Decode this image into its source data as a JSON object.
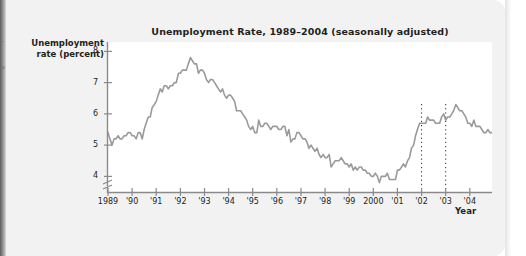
{
  "page": {
    "margin_marks": [
      {
        "text": "–",
        "x": 1,
        "y": 40
      },
      {
        "text": "a",
        "x": 1,
        "y": 66
      }
    ]
  },
  "figure": {
    "title": "Unemployment Rate, 1989–2004 (seasonally adjusted)",
    "y_axis_label_line1": "Unemployment",
    "y_axis_label_line2": "rate (percent)",
    "x_axis_label": "Year",
    "line_color": "#9a9a9a",
    "axis_color": "#7a7a7a",
    "text_color": "#231f20",
    "panel_color": "#ffffff",
    "card_color": "#f2f2f2"
  },
  "chart_data": {
    "type": "line",
    "title": "Unemployment Rate, 1989–2004 (seasonally adjusted)",
    "xlabel": "Year",
    "ylabel": "Unemployment rate (percent)",
    "xlim": [
      1989,
      2004.92
    ],
    "ylim": [
      3.5,
      8.3
    ],
    "y_axis_break": true,
    "grid": false,
    "legend": "none",
    "ytick_labels": [
      "8",
      "7",
      "6",
      "5",
      "4"
    ],
    "ytick_values": [
      8,
      7,
      6,
      5,
      4
    ],
    "xtick_labels": [
      "1989",
      "'90",
      "'91",
      "'92",
      "'93",
      "'94",
      "'95",
      "'96",
      "'97",
      "'98",
      "'99",
      "2000",
      "'01",
      "'02",
      "'03",
      "'04"
    ],
    "xtick_values": [
      1989,
      1990,
      1991,
      1992,
      1993,
      1994,
      1995,
      1996,
      1997,
      1998,
      1999,
      2000,
      2001,
      2002,
      2003,
      2004
    ],
    "annotations": [
      {
        "name": "dotted-line-2002",
        "type": "vertical-dotted-line",
        "x": 2002
      },
      {
        "name": "dotted-line-2003",
        "type": "vertical-dotted-line",
        "x": 2003
      }
    ],
    "series": [
      {
        "name": "Unemployment rate",
        "color": "#9a9a9a",
        "x": [
          1989.0,
          1989.08,
          1989.17,
          1989.25,
          1989.33,
          1989.42,
          1989.5,
          1989.58,
          1989.67,
          1989.75,
          1989.83,
          1989.92,
          1990.0,
          1990.08,
          1990.17,
          1990.25,
          1990.33,
          1990.42,
          1990.5,
          1990.58,
          1990.67,
          1990.75,
          1990.83,
          1990.92,
          1991.0,
          1991.08,
          1991.17,
          1991.25,
          1991.33,
          1991.42,
          1991.5,
          1991.58,
          1991.67,
          1991.75,
          1991.83,
          1991.92,
          1992.0,
          1992.08,
          1992.17,
          1992.25,
          1992.33,
          1992.42,
          1992.5,
          1992.58,
          1992.67,
          1992.75,
          1992.83,
          1992.92,
          1993.0,
          1993.08,
          1993.17,
          1993.25,
          1993.33,
          1993.42,
          1993.5,
          1993.58,
          1993.67,
          1993.75,
          1993.83,
          1993.92,
          1994.0,
          1994.08,
          1994.17,
          1994.25,
          1994.33,
          1994.42,
          1994.5,
          1994.58,
          1994.67,
          1994.75,
          1994.83,
          1994.92,
          1995.0,
          1995.08,
          1995.17,
          1995.25,
          1995.33,
          1995.42,
          1995.5,
          1995.58,
          1995.67,
          1995.75,
          1995.83,
          1995.92,
          1996.0,
          1996.08,
          1996.17,
          1996.25,
          1996.33,
          1996.42,
          1996.5,
          1996.58,
          1996.67,
          1996.75,
          1996.83,
          1996.92,
          1997.0,
          1997.08,
          1997.17,
          1997.25,
          1997.33,
          1997.42,
          1997.5,
          1997.58,
          1997.67,
          1997.75,
          1997.83,
          1997.92,
          1998.0,
          1998.08,
          1998.17,
          1998.25,
          1998.33,
          1998.42,
          1998.5,
          1998.58,
          1998.67,
          1998.75,
          1998.83,
          1998.92,
          1999.0,
          1999.08,
          1999.17,
          1999.25,
          1999.33,
          1999.42,
          1999.5,
          1999.58,
          1999.67,
          1999.75,
          1999.83,
          1999.92,
          2000.0,
          2000.08,
          2000.17,
          2000.25,
          2000.33,
          2000.42,
          2000.5,
          2000.58,
          2000.67,
          2000.75,
          2000.83,
          2000.92,
          2001.0,
          2001.08,
          2001.17,
          2001.25,
          2001.33,
          2001.42,
          2001.5,
          2001.58,
          2001.67,
          2001.75,
          2001.83,
          2001.92,
          2002.0,
          2002.08,
          2002.17,
          2002.25,
          2002.33,
          2002.42,
          2002.5,
          2002.58,
          2002.67,
          2002.75,
          2002.83,
          2002.92,
          2003.0,
          2003.08,
          2003.17,
          2003.25,
          2003.33,
          2003.42,
          2003.5,
          2003.58,
          2003.67,
          2003.75,
          2003.83,
          2003.92,
          2004.0,
          2004.08,
          2004.17,
          2004.25,
          2004.33,
          2004.42,
          2004.5,
          2004.58,
          2004.67,
          2004.75,
          2004.83,
          2004.92
        ],
        "values": [
          5.4,
          5.2,
          5.0,
          5.2,
          5.2,
          5.3,
          5.2,
          5.2,
          5.3,
          5.3,
          5.4,
          5.4,
          5.3,
          5.3,
          5.2,
          5.4,
          5.4,
          5.2,
          5.5,
          5.7,
          5.9,
          5.9,
          6.2,
          6.3,
          6.4,
          6.6,
          6.8,
          6.7,
          6.9,
          6.9,
          6.8,
          6.9,
          6.9,
          7.0,
          7.0,
          7.3,
          7.3,
          7.4,
          7.4,
          7.4,
          7.6,
          7.8,
          7.7,
          7.6,
          7.6,
          7.3,
          7.4,
          7.4,
          7.3,
          7.1,
          7.0,
          7.1,
          7.1,
          7.0,
          6.9,
          6.8,
          6.7,
          6.8,
          6.6,
          6.5,
          6.6,
          6.6,
          6.5,
          6.4,
          6.1,
          6.1,
          6.1,
          6.0,
          5.9,
          5.8,
          5.6,
          5.5,
          5.6,
          5.4,
          5.4,
          5.8,
          5.6,
          5.6,
          5.7,
          5.7,
          5.6,
          5.5,
          5.6,
          5.6,
          5.6,
          5.5,
          5.5,
          5.6,
          5.6,
          5.3,
          5.5,
          5.1,
          5.2,
          5.2,
          5.4,
          5.4,
          5.3,
          5.2,
          5.2,
          5.1,
          4.9,
          5.0,
          4.9,
          4.8,
          4.9,
          4.7,
          4.6,
          4.7,
          4.6,
          4.6,
          4.7,
          4.3,
          4.4,
          4.5,
          4.5,
          4.5,
          4.6,
          4.5,
          4.4,
          4.4,
          4.3,
          4.4,
          4.2,
          4.3,
          4.2,
          4.3,
          4.3,
          4.2,
          4.2,
          4.1,
          4.1,
          4.0,
          4.0,
          4.1,
          4.0,
          3.8,
          4.0,
          4.0,
          4.0,
          4.1,
          3.9,
          3.9,
          3.9,
          3.9,
          4.2,
          4.2,
          4.3,
          4.4,
          4.3,
          4.5,
          4.6,
          4.9,
          5.0,
          5.3,
          5.5,
          5.7,
          5.7,
          5.7,
          5.7,
          5.9,
          5.8,
          5.8,
          5.8,
          5.7,
          5.7,
          5.7,
          5.9,
          6.0,
          5.8,
          5.9,
          5.9,
          6.0,
          6.1,
          6.3,
          6.2,
          6.1,
          6.1,
          6.0,
          5.9,
          5.7,
          5.7,
          5.6,
          5.8,
          5.6,
          5.6,
          5.6,
          5.5,
          5.4,
          5.4,
          5.5,
          5.4,
          5.4
        ]
      }
    ]
  }
}
